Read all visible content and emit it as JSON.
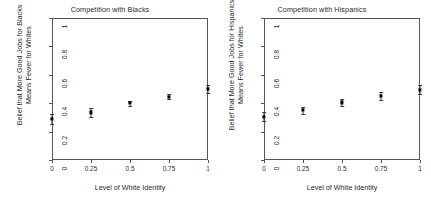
{
  "chart_data": [
    {
      "type": "scatter",
      "title": "Competition with Blacks",
      "xlabel": "Level of White Identity",
      "ylabel": "Belief that More Good Jobs for Blacks Means Fewer for Whites",
      "ylabel_line1": "Belief that More Good Jobs for Blacks",
      "ylabel_line2": "Means Fewer for Whites",
      "x": [
        0,
        0.25,
        0.5,
        0.75,
        1
      ],
      "values": [
        0.29,
        0.335,
        0.4,
        0.447,
        0.5
      ],
      "err_low": [
        0.255,
        0.305,
        0.383,
        0.428,
        0.475
      ],
      "err_high": [
        0.325,
        0.365,
        0.418,
        0.468,
        0.527
      ],
      "xticks": [
        "0",
        "0.25",
        "0.5",
        "0.75",
        "1"
      ],
      "xtick_values": [
        0,
        0.25,
        0.5,
        0.75,
        1
      ],
      "yticks": [
        "0",
        "0.2",
        "0.4",
        "0.6",
        "0.8",
        "1"
      ],
      "ytick_values": [
        0,
        0.2,
        0.4,
        0.6,
        0.8,
        1
      ],
      "xlim": [
        0,
        1
      ],
      "ylim": [
        0,
        1
      ],
      "grid": false,
      "legend": "none"
    },
    {
      "type": "scatter",
      "title": "Competition with Hispanics",
      "xlabel": "Level of White Identity",
      "ylabel": "Belief that More Good Jobs for Hispanics Means Fewer for Whites",
      "ylabel_line1": "Belief that More Good Jobs for Hispanics",
      "ylabel_line2": "Means Fewer for Whites",
      "x": [
        0,
        0.25,
        0.5,
        0.75,
        1
      ],
      "values": [
        0.305,
        0.35,
        0.405,
        0.45,
        0.495
      ],
      "err_low": [
        0.275,
        0.325,
        0.378,
        0.425,
        0.462
      ],
      "err_high": [
        0.335,
        0.375,
        0.432,
        0.478,
        0.528
      ],
      "xticks": [
        "0",
        "0.25",
        "0.5",
        "0.75",
        "1"
      ],
      "xtick_values": [
        0,
        0.25,
        0.5,
        0.75,
        1
      ],
      "yticks": [
        "0",
        "0.2",
        "0.4",
        "0.6",
        "0.8",
        "1"
      ],
      "ytick_values": [
        0,
        0.2,
        0.4,
        0.6,
        0.8,
        1
      ],
      "xlim": [
        0,
        1
      ],
      "ylim": [
        0,
        1
      ],
      "grid": false,
      "legend": "none"
    }
  ]
}
